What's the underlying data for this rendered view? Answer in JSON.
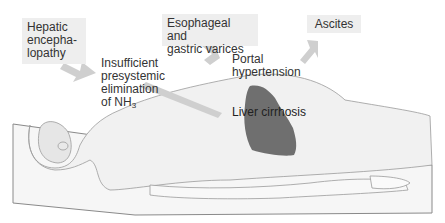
{
  "diagram": {
    "boxes": {
      "hepatic": [
        "Hepatic",
        "encepha-",
        "lopathy"
      ],
      "varices": [
        "Esophageal and",
        "gastric varices"
      ],
      "ascites": "Ascites"
    },
    "labels": {
      "insufficient": [
        "Insufficient",
        "presystemic",
        "elimination"
      ],
      "nh3_prefix": "of NH",
      "nh3_sub": "3",
      "portal": [
        "Portal",
        "hypertension"
      ],
      "liver": "Liver cirrhosis"
    },
    "colors": {
      "box_bg": "#eeeeee",
      "arrow": "#cfcfcf",
      "liver": "#6f6f6f",
      "outline": "#9a9a9a"
    }
  }
}
